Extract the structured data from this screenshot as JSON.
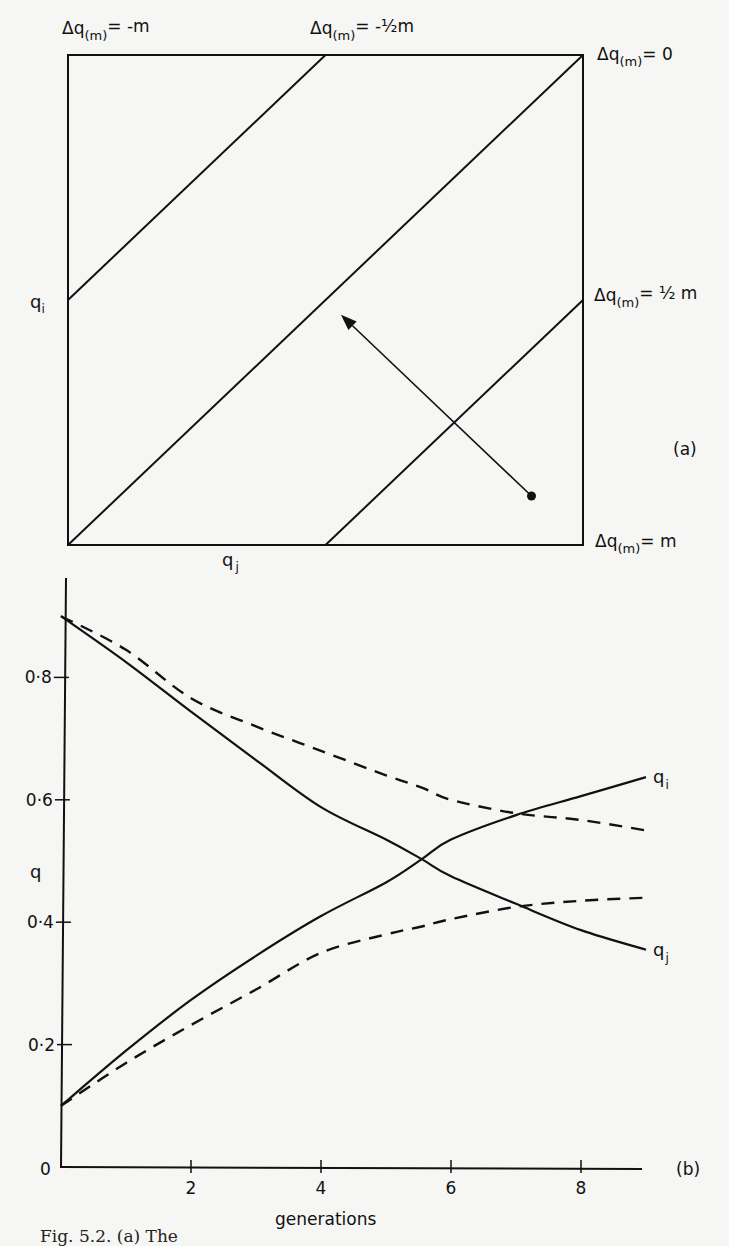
{
  "figure_a": {
    "panel_label": "(a)",
    "axis_x_label": "q",
    "axis_x_sub": "j",
    "axis_y_label": "q",
    "axis_y_sub": "i",
    "line_labels": [
      {
        "id": "neg_m",
        "prefix": "Δq",
        "sub": "(m)",
        "eq": "= -m"
      },
      {
        "id": "neg_half",
        "prefix": "Δq",
        "sub": "(m)",
        "eq": "= -½m"
      },
      {
        "id": "zero",
        "prefix": "Δq",
        "sub": "(m)",
        "eq": "= 0"
      },
      {
        "id": "pos_half",
        "prefix": "Δq",
        "sub": "(m)",
        "eq": "= ½ m"
      },
      {
        "id": "pos_m",
        "prefix": "Δq",
        "sub": "(m)",
        "eq": "= m"
      }
    ],
    "diagonals": [
      {
        "name": "delta-neg-half-line",
        "qi_minus_qj": 0.5
      },
      {
        "name": "delta-zero-line",
        "qi_minus_qj": 0.0
      },
      {
        "name": "delta-pos-half-line",
        "qi_minus_qj": -0.5
      }
    ],
    "trajectory": {
      "start": {
        "qj": 0.9,
        "qi": 0.1
      },
      "end": {
        "qj": 0.53,
        "qi": 0.47
      }
    }
  },
  "chart_data": {
    "type": "line",
    "title": "",
    "panel_label": "(b)",
    "xlabel": "generations",
    "ylabel": "q",
    "xlim": [
      0,
      9.4
    ],
    "ylim": [
      0,
      0.97
    ],
    "x_ticks": [
      2,
      4,
      6,
      8
    ],
    "y_ticks": [
      0.2,
      0.4,
      0.6,
      0.8
    ],
    "y_tick_labels": [
      "0·2",
      "0·4",
      "0·6",
      "0·8"
    ],
    "origin_label": "0",
    "grid": false,
    "x": [
      0,
      1,
      2,
      3,
      4,
      5,
      5.55,
      6,
      7,
      8,
      9
    ],
    "series": [
      {
        "name": "q_i (solid)",
        "style": "solid",
        "end_label": "q",
        "end_sub": "i",
        "values": [
          0.1,
          0.19,
          0.273,
          0.345,
          0.41,
          0.465,
          0.503,
          0.535,
          0.575,
          0.606,
          0.637
        ]
      },
      {
        "name": "q_j (solid)",
        "style": "solid",
        "end_label": "q",
        "end_sub": "j",
        "values": [
          0.9,
          0.825,
          0.744,
          0.665,
          0.588,
          0.535,
          0.503,
          0.475,
          0.43,
          0.387,
          0.355
        ]
      },
      {
        "name": "q_i (dashed)",
        "style": "dashed",
        "values": [
          0.1,
          0.17,
          0.232,
          0.29,
          0.35,
          0.38,
          0.393,
          0.405,
          0.425,
          0.435,
          0.44
        ]
      },
      {
        "name": "q_j (dashed)",
        "style": "dashed",
        "values": [
          0.9,
          0.845,
          0.766,
          0.72,
          0.68,
          0.64,
          0.62,
          0.6,
          0.578,
          0.567,
          0.55
        ]
      }
    ]
  },
  "caption": "Fig. 5.2. (a) The"
}
